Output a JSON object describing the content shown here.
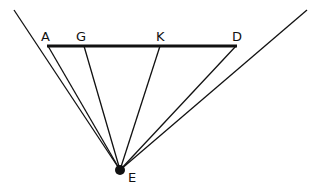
{
  "diagram": {
    "labels": {
      "A": "A",
      "G": "G",
      "K": "K",
      "D": "D",
      "E": "E"
    },
    "points": {
      "A": [
        48,
        46
      ],
      "G": [
        84,
        46
      ],
      "K": [
        160,
        46
      ],
      "D": [
        236,
        46
      ],
      "E": [
        120,
        170
      ],
      "left_ray_end": [
        14,
        10
      ],
      "right_ray_end": [
        307,
        10
      ]
    },
    "segments": [
      {
        "from": "A",
        "to": "D",
        "weight": "thick"
      },
      {
        "from": "E",
        "to": "A"
      },
      {
        "from": "E",
        "to": "G"
      },
      {
        "from": "E",
        "to": "K"
      },
      {
        "from": "E",
        "to": "D"
      },
      {
        "from": "E",
        "to": "left_ray_end"
      },
      {
        "from": "E",
        "to": "right_ray_end"
      }
    ],
    "colors": {
      "line": "#111111",
      "background": "#ffffff"
    }
  }
}
